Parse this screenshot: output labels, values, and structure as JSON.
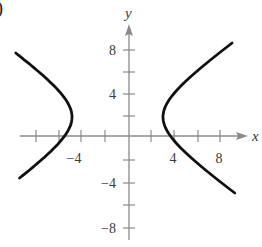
{
  "figure": {
    "partial_label": ")"
  },
  "chart_data": {
    "type": "line",
    "title": "",
    "xlabel": "x",
    "ylabel": "y",
    "xlim": [
      -10,
      10
    ],
    "ylim": [
      -9,
      9
    ],
    "grid": false,
    "legend": null,
    "x_ticks": [
      -8,
      -6,
      -4,
      -2,
      2,
      4,
      6,
      8
    ],
    "x_tick_labels": [
      "-4",
      "4",
      "8"
    ],
    "y_ticks": [
      -8,
      -6,
      -4,
      -2,
      2,
      4,
      6,
      8
    ],
    "y_tick_labels": [
      "8",
      "4",
      "-4",
      "-8"
    ],
    "series": [
      {
        "name": "left branch",
        "points": [
          [
            -9.5,
            7.0
          ],
          [
            -7.5,
            5.0
          ],
          [
            -5.5,
            2.9
          ],
          [
            -5.0,
            1.6
          ],
          [
            -5.8,
            0.0
          ],
          [
            -7.5,
            -2.6
          ],
          [
            -9.5,
            -3.6
          ]
        ]
      },
      {
        "name": "right branch",
        "points": [
          [
            9.0,
            8.2
          ],
          [
            6.0,
            5.5
          ],
          [
            3.8,
            3.0
          ],
          [
            3.0,
            1.8
          ],
          [
            3.6,
            0.0
          ],
          [
            6.0,
            -3.2
          ],
          [
            8.8,
            -5.0
          ]
        ]
      }
    ],
    "center_estimate": [
      -1,
      2
    ],
    "vertices_estimate": [
      [
        -5,
        2
      ],
      [
        3,
        2
      ]
    ]
  },
  "labels": {
    "x_axis": "x",
    "y_axis": "y",
    "x_neg4": "−4",
    "x_4": "4",
    "x_8": "8",
    "y_8": "8",
    "y_4": "4",
    "y_neg4": "−4",
    "y_neg8": "−8"
  },
  "colors": {
    "axis": "#8a8a8a",
    "curve": "#111111",
    "text": "#3a3a3a"
  }
}
